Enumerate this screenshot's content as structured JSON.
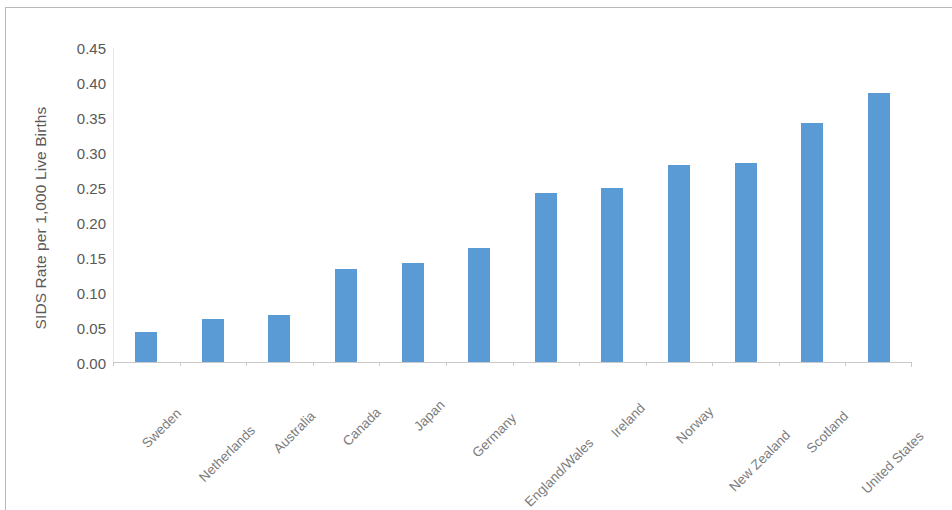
{
  "chart_data": {
    "type": "bar",
    "title": "",
    "subtitle": "",
    "xlabel": "",
    "ylabel": "SIDS Rate per 1,000 Live Births",
    "categories": [
      "Sweden",
      "Netherlands",
      "Australia",
      "Canada",
      "Japan",
      "Germany",
      "England/Wales",
      "Ireland",
      "Norway",
      "New Zealand",
      "Scotland",
      "United States"
    ],
    "values": [
      0.043,
      0.061,
      0.067,
      0.133,
      0.142,
      0.163,
      0.241,
      0.249,
      0.281,
      0.285,
      0.341,
      0.384
    ],
    "ylim": [
      0.0,
      0.45
    ],
    "ytick_step": 0.05,
    "ytick_labels": [
      "0.45",
      "0.40",
      "0.35",
      "0.30",
      "0.25",
      "0.20",
      "0.15",
      "0.10",
      "0.05",
      "0.00"
    ],
    "ytick_values": [
      0.45,
      0.4,
      0.35,
      0.3,
      0.25,
      0.2,
      0.15,
      0.1,
      0.05,
      0.0
    ],
    "grid": false,
    "legend": false,
    "legend_position": "none",
    "series": [
      {
        "name": "SIDS Rate",
        "values": [
          0.043,
          0.061,
          0.067,
          0.133,
          0.142,
          0.163,
          0.241,
          0.249,
          0.281,
          0.285,
          0.341,
          0.384
        ]
      }
    ],
    "colors": {
      "bar": "#5b9bd5",
      "axis_line": "#c9c9c9",
      "tick_text": "#595959",
      "category_text": "#7b7b7b",
      "frame": "#b8b8b8",
      "background": "#ffffff"
    },
    "x_label_rotation": 45
  }
}
